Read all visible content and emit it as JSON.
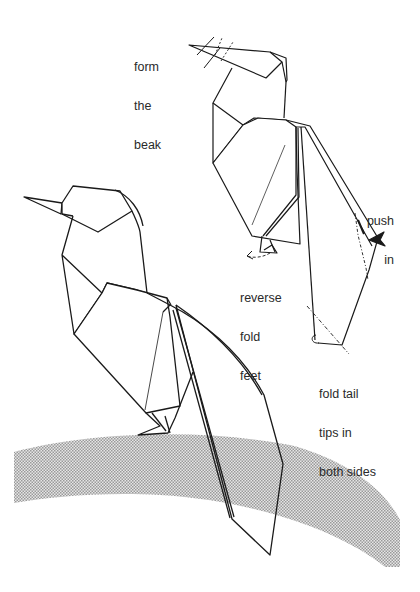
{
  "diagram": {
    "figures": [
      {
        "id": "step",
        "description": "intermediate model with fold annotations"
      },
      {
        "id": "finished",
        "description": "completed bird standing on ground"
      }
    ],
    "annotations": {
      "beak": {
        "lines": [
          "form",
          "the",
          "beak"
        ]
      },
      "push": {
        "lines": [
          "push",
          "in"
        ]
      },
      "feet": {
        "lines": [
          "reverse",
          "fold",
          "feet"
        ]
      },
      "tail": {
        "lines": [
          "fold tail",
          "tips in",
          "both sides"
        ]
      }
    },
    "colors": {
      "line": "#1a1a1a",
      "text": "#2a2a2a",
      "ground_shade": "#c8c8c8",
      "background": "#ffffff"
    }
  }
}
